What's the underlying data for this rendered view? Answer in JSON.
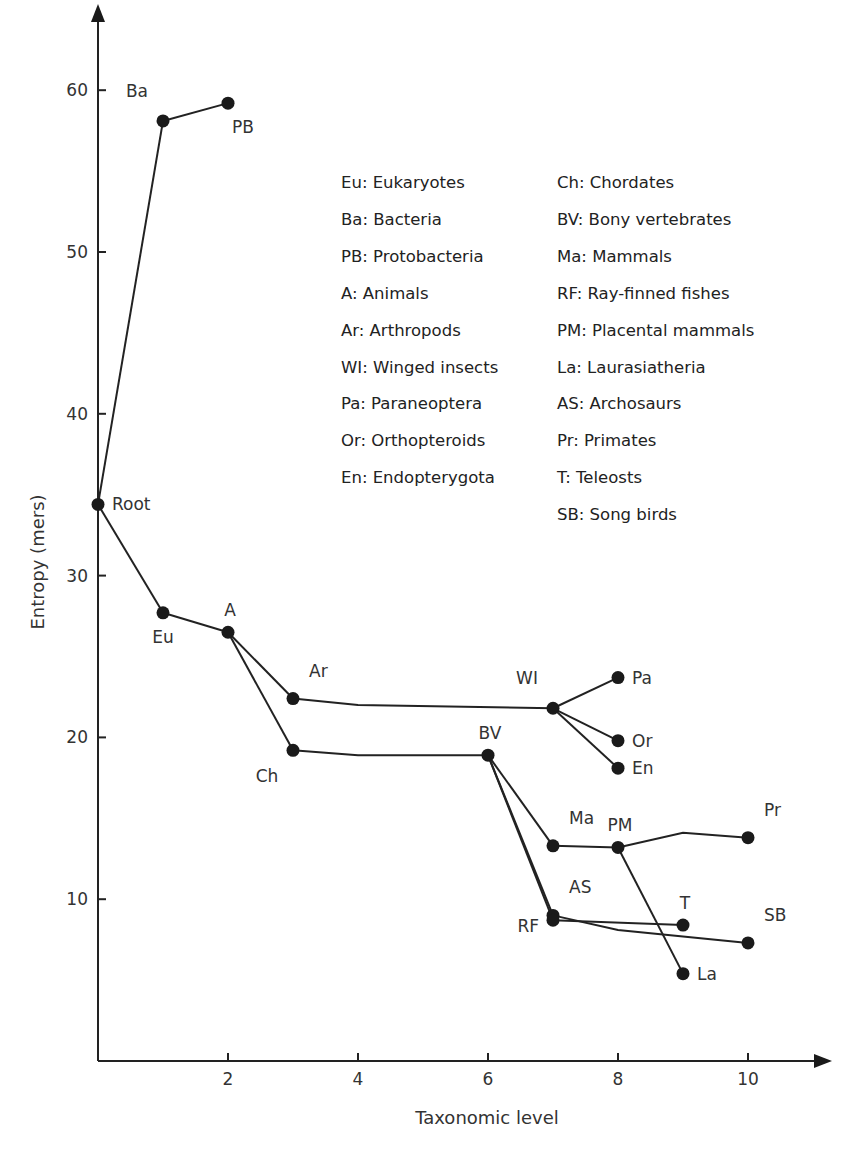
{
  "chart_data": {
    "type": "line",
    "title": "",
    "xlabel": "Taxonomic level",
    "ylabel": "Entropy (mers)",
    "xlim": [
      0,
      11.4
    ],
    "ylim": [
      0,
      64
    ],
    "x_ticks": [
      2,
      4,
      6,
      8,
      10
    ],
    "y_ticks": [
      10,
      20,
      30,
      40,
      50,
      60
    ],
    "grid": false,
    "legend_position": "top-center (two columns)",
    "nodes": [
      {
        "id": "Root",
        "x": 0,
        "y": 34.4,
        "label_pos": "right"
      },
      {
        "id": "Ba",
        "x": 1,
        "y": 58.1,
        "label_pos": "upper-left"
      },
      {
        "id": "PB",
        "x": 2,
        "y": 59.2,
        "label_pos": "lower-right"
      },
      {
        "id": "Eu",
        "x": 1,
        "y": 27.7,
        "label_pos": "below"
      },
      {
        "id": "A",
        "x": 2,
        "y": 26.5,
        "label_pos": "above"
      },
      {
        "id": "Ar",
        "x": 3,
        "y": 22.4,
        "label_pos": "upper-right"
      },
      {
        "id": "Ch",
        "x": 3,
        "y": 19.2,
        "label_pos": "lower-left"
      },
      {
        "id": "WI",
        "x": 7,
        "y": 21.8,
        "label_pos": "upper-left"
      },
      {
        "id": "Pa",
        "x": 8,
        "y": 23.7,
        "label_pos": "right"
      },
      {
        "id": "Or",
        "x": 8,
        "y": 19.8,
        "label_pos": "right"
      },
      {
        "id": "En",
        "x": 8,
        "y": 18.1,
        "label_pos": "right"
      },
      {
        "id": "BV",
        "x": 6,
        "y": 18.9,
        "label_pos": "above"
      },
      {
        "id": "Ma",
        "x": 7,
        "y": 13.3,
        "label_pos": "upper-right"
      },
      {
        "id": "PM",
        "x": 8,
        "y": 13.2,
        "label_pos": "above"
      },
      {
        "id": "Pr",
        "x": 10,
        "y": 13.8,
        "label_pos": "upper-right"
      },
      {
        "id": "AS",
        "x": 7,
        "y": 9.0,
        "label_pos": "upper-right"
      },
      {
        "id": "RF",
        "x": 7,
        "y": 8.7,
        "label_pos": "left"
      },
      {
        "id": "T",
        "x": 9,
        "y": 8.4,
        "label_pos": "above"
      },
      {
        "id": "SB",
        "x": 10,
        "y": 7.3,
        "label_pos": "upper-right"
      },
      {
        "id": "La",
        "x": 9,
        "y": 5.4,
        "label_pos": "right"
      }
    ],
    "edges": [
      {
        "from": "Root",
        "to": "Ba"
      },
      {
        "from": "Ba",
        "to": "PB"
      },
      {
        "from": "Root",
        "to": "Eu"
      },
      {
        "from": "Eu",
        "to": "A"
      },
      {
        "from": "A",
        "to": "Ar"
      },
      {
        "from": "A",
        "to": "Ch"
      },
      {
        "from": "Ar",
        "to": "WI",
        "via": [
          [
            4,
            22.0
          ]
        ]
      },
      {
        "from": "WI",
        "to": "Pa"
      },
      {
        "from": "WI",
        "to": "Or"
      },
      {
        "from": "WI",
        "to": "En"
      },
      {
        "from": "Ch",
        "to": "BV",
        "via": [
          [
            4,
            18.9
          ]
        ]
      },
      {
        "from": "BV",
        "to": "Ma"
      },
      {
        "from": "BV",
        "to": "AS"
      },
      {
        "from": "BV",
        "to": "RF"
      },
      {
        "from": "Ma",
        "to": "PM"
      },
      {
        "from": "PM",
        "to": "Pr",
        "via": [
          [
            9,
            14.1
          ]
        ]
      },
      {
        "from": "PM",
        "to": "La"
      },
      {
        "from": "RF",
        "to": "T"
      },
      {
        "from": "AS",
        "to": "SB",
        "via": [
          [
            8,
            8.1
          ]
        ]
      }
    ],
    "legend": [
      [
        "Eu",
        "Eukaryotes"
      ],
      [
        "Ba",
        "Bacteria"
      ],
      [
        "PB",
        "Protobacteria"
      ],
      [
        "A",
        "Animals"
      ],
      [
        "Ar",
        "Arthropods"
      ],
      [
        "WI",
        "Winged insects"
      ],
      [
        "Pa",
        "Paraneoptera"
      ],
      [
        "Or",
        "Orthopteroids"
      ],
      [
        "En",
        "Endopterygota"
      ],
      [
        "Ch",
        "Chordates"
      ],
      [
        "BV",
        "Bony vertebrates"
      ],
      [
        "Ma",
        "Mammals"
      ],
      [
        "RF",
        "Ray-finned fishes"
      ],
      [
        "PM",
        "Placental mammals"
      ],
      [
        "La",
        "Laurasiatheria"
      ],
      [
        "AS",
        "Archosaurs"
      ],
      [
        "Pr",
        "Primates"
      ],
      [
        "T",
        "Teleosts"
      ],
      [
        "SB",
        "Song birds"
      ]
    ]
  },
  "legend_text": {
    "left": [
      "Eu: Eukaryotes",
      "Ba: Bacteria",
      "PB: Protobacteria",
      "A: Animals",
      "Ar: Arthropods",
      "WI: Winged insects",
      "Pa: Paraneoptera",
      "Or: Orthopteroids",
      "En: Endopterygota"
    ],
    "right": [
      "Ch: Chordates",
      "BV: Bony vertebrates",
      "Ma: Mammals",
      "RF: Ray-finned fishes",
      "PM: Placental mammals",
      "La: Laurasiatheria",
      "AS: Archosaurs",
      "Pr: Primates",
      "T: Teleosts",
      "SB: Song birds"
    ]
  },
  "colors": {
    "ink": "#1a1a1a",
    "text": "#333333",
    "background": "#ffffff"
  }
}
